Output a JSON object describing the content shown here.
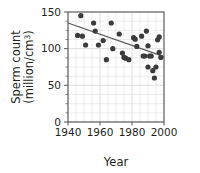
{
  "chart_data": {
    "type": "scatter",
    "title": "",
    "xlabel": "Year",
    "ylabel": "Sperm count (million/cm3)",
    "ylabel_line1": "Sperm count",
    "ylabel_line2_prefix": "(million/cm",
    "ylabel_line2_exponent": "3",
    "ylabel_line2_suffix": ")",
    "xlim": [
      1940,
      2000
    ],
    "ylim": [
      0,
      150
    ],
    "xticks": [
      1940,
      1960,
      1980,
      2000
    ],
    "xtick_labels": [
      "1940",
      "1960",
      "1980",
      "2000"
    ],
    "yticks": [
      0,
      50,
      100,
      150
    ],
    "ytick_labels": [
      "0",
      "50",
      "100",
      "150"
    ],
    "minor_xtick_step": 5,
    "minor_ytick_step": 12.5,
    "grid": true,
    "grid_color": "#d9d9d9",
    "frame_color": "#58595b",
    "marker_color": "#3b3b3b",
    "marker_size": 2.6,
    "legend": "none",
    "series": [
      {
        "name": "Sperm count observations",
        "marker": "circle",
        "points": [
          [
            1946,
            118
          ],
          [
            1948,
            145
          ],
          [
            1949,
            117
          ],
          [
            1951,
            105
          ],
          [
            1956,
            135
          ],
          [
            1957,
            124
          ],
          [
            1959,
            105
          ],
          [
            1962,
            111
          ],
          [
            1964,
            85
          ],
          [
            1967,
            135
          ],
          [
            1968,
            100
          ],
          [
            1972,
            120
          ],
          [
            1974,
            94
          ],
          [
            1975,
            88
          ],
          [
            1976,
            87
          ],
          [
            1978,
            85
          ],
          [
            1981,
            115
          ],
          [
            1982,
            113
          ],
          [
            1983,
            103
          ],
          [
            1986,
            117
          ],
          [
            1987,
            90
          ],
          [
            1988,
            90
          ],
          [
            1989,
            124
          ],
          [
            1990,
            104
          ],
          [
            1990,
            75
          ],
          [
            1991,
            90
          ],
          [
            1992,
            90
          ],
          [
            1993,
            70
          ],
          [
            1994,
            60
          ],
          [
            1995,
            75
          ],
          [
            1996,
            112
          ],
          [
            1997,
            116
          ],
          [
            1997,
            95
          ],
          [
            1998,
            88
          ]
        ]
      }
    ],
    "trendline": {
      "name": "linear trend",
      "x_start": 1940,
      "y_start": 135,
      "x_end": 2000,
      "y_end": 89,
      "color": "#58595b"
    }
  }
}
